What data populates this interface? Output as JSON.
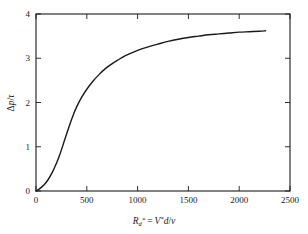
{
  "chart_data": {
    "type": "line",
    "title": "",
    "subtitle": "",
    "xlabel": "R_d* = V*d/ν",
    "xlabel_parts": {
      "sym": "R",
      "sub": "d",
      "star1": "*",
      "eq": "=",
      "v": "V",
      "star2": "*",
      "d": "d",
      "slash": "/",
      "nu": "ν"
    },
    "ylabel": "Δp/τ",
    "ylabel_parts": {
      "delta": "Δ",
      "p": "p",
      "slash": "/",
      "tau": "τ"
    },
    "xlim": [
      0,
      2500
    ],
    "ylim": [
      0,
      4
    ],
    "xticks": [
      0,
      500,
      1000,
      1500,
      2000,
      2500
    ],
    "xtick_labels": [
      "0",
      "500",
      "1000",
      "1500",
      "2000",
      "2500"
    ],
    "yticks": [
      0,
      1,
      2,
      3,
      4
    ],
    "ytick_labels": [
      "0",
      "1",
      "2",
      "3",
      "4"
    ],
    "grid": false,
    "legend": false,
    "legend_position": "none",
    "tick_direction": "in",
    "frame": "box",
    "line_color": "#1a1a1a",
    "line_width": 1.4,
    "series": [
      {
        "name": "pressure-drop-curve",
        "x": [
          0,
          40,
          80,
          120,
          160,
          200,
          240,
          280,
          320,
          360,
          400,
          450,
          500,
          560,
          620,
          680,
          740,
          800,
          880,
          960,
          1040,
          1120,
          1200,
          1300,
          1400,
          1500,
          1600,
          1700,
          1800,
          1900,
          2000,
          2100,
          2200,
          2260
        ],
        "y": [
          0.0,
          0.06,
          0.14,
          0.26,
          0.42,
          0.62,
          0.86,
          1.14,
          1.42,
          1.68,
          1.9,
          2.12,
          2.3,
          2.48,
          2.63,
          2.76,
          2.86,
          2.95,
          3.06,
          3.14,
          3.21,
          3.27,
          3.32,
          3.38,
          3.43,
          3.47,
          3.5,
          3.53,
          3.55,
          3.57,
          3.59,
          3.6,
          3.61,
          3.62
        ]
      }
    ],
    "asymptote_value": 3.62,
    "curve_start": [
      0,
      0
    ],
    "curve_end": [
      2260,
      3.62
    ]
  }
}
